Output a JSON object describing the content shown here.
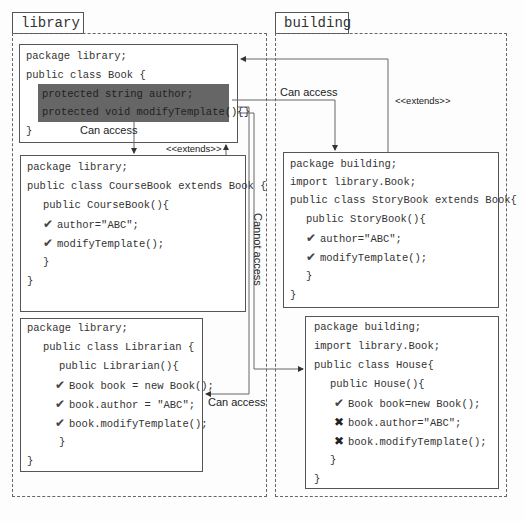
{
  "packages": {
    "library": {
      "label": "library"
    },
    "building": {
      "label": "building"
    }
  },
  "classes": {
    "book": {
      "lines": [
        "package library;",
        "public class Book {",
        "}"
      ],
      "highlighted": [
        "protected string author;",
        "protected void modifyTemplate(){}"
      ]
    },
    "coursebook": {
      "lines": [
        "package library;",
        "public class CourseBook extends Book {",
        "public CourseBook(){",
        "author=\"ABC\";",
        "modifyTemplate();",
        "}",
        "}"
      ],
      "marks": [
        "check",
        "check"
      ]
    },
    "librarian": {
      "lines": [
        "package library;",
        "public class Librarian {",
        "public Librarian(){",
        "Book book = new Book();",
        "book.author = \"ABC\";",
        "book.modifyTemplate();",
        "}",
        "}"
      ],
      "marks": [
        "check",
        "check",
        "check"
      ]
    },
    "storybook": {
      "lines": [
        "package building;",
        "import library.Book;",
        "public class StoryBook extends Book{",
        "public StoryBook(){",
        "author=\"ABC\";",
        "modifyTemplate();",
        "}",
        "}"
      ],
      "marks": [
        "check",
        "check"
      ]
    },
    "house": {
      "lines": [
        "package building;",
        "import library.Book;",
        "public class House{",
        "public House(){",
        "Book book=new Book();",
        "book.author=\"ABC\";",
        "book.modifyTemplate();",
        "}",
        "}"
      ],
      "marks": [
        "check",
        "cross",
        "cross"
      ]
    }
  },
  "connectors": {
    "can_access_coursebook": "Can access",
    "can_access_storybook": "Can access",
    "can_access_librarian": "Can access",
    "cannot_access_house": "Cannot access",
    "extends_coursebook": "<<extends>>",
    "extends_storybook": "<<extends>>"
  },
  "icons": {
    "check": "✔",
    "cross": "✖"
  },
  "colors": {
    "highlight": "#666666",
    "border": "#555555",
    "dashed": "#666666"
  }
}
